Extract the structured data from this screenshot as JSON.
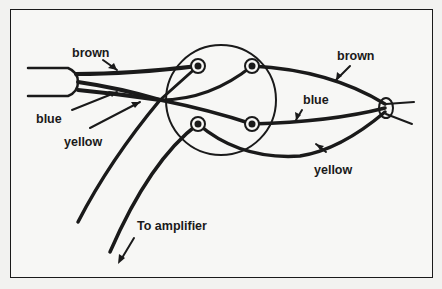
{
  "diagram": {
    "type": "wiring diagram",
    "labels": {
      "brown_left": "brown",
      "blue_left": "blue",
      "yellow_left": "yellow",
      "brown_right": "brown",
      "blue_right": "blue",
      "yellow_right": "yellow",
      "amplifier": "To amplifier"
    },
    "components": [
      "cable",
      "circular terminal plate",
      "4 terminals",
      "pickup/connector end"
    ],
    "wires": [
      "brown",
      "blue",
      "yellow"
    ],
    "colors": {
      "ink": "#1a1a1a",
      "background": "#f7f7f5"
    }
  }
}
